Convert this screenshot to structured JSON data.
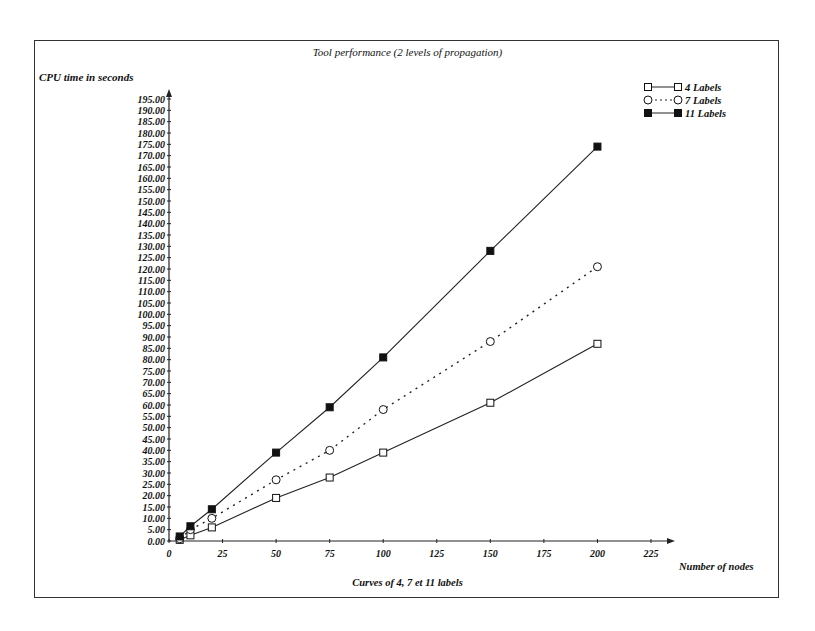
{
  "chart_data": {
    "type": "line",
    "title": "Tool performance (2 levels of propagation)",
    "ylabel": "CPU time in seconds",
    "xlabel": "Number of nodes",
    "caption": "Curves of 4, 7 et 11 labels",
    "xlim": [
      0,
      225
    ],
    "ylim": [
      0,
      195
    ],
    "x_ticks": [
      0,
      25,
      50,
      75,
      100,
      125,
      150,
      175,
      200,
      225
    ],
    "y_ticks": [
      "0.00",
      "5.00",
      "10.00",
      "15.00",
      "20.00",
      "25.00",
      "30.00",
      "35.00",
      "40.00",
      "45.00",
      "50.00",
      "55.00",
      "60.00",
      "65.00",
      "70.00",
      "75.00",
      "80.00",
      "85.00",
      "90.00",
      "95.00",
      "100.00",
      "105.00",
      "110.00",
      "115.00",
      "120.00",
      "125.00",
      "130.00",
      "135.00",
      "140.00",
      "145.00",
      "150.00",
      "155.00",
      "160.00",
      "165.00",
      "170.00",
      "175.00",
      "180.00",
      "185.00",
      "190.00",
      "195.00"
    ],
    "grid": false,
    "legend_position": "top-right",
    "x": [
      5,
      10,
      20,
      50,
      75,
      100,
      150,
      200
    ],
    "series": [
      {
        "name": "4 Labels",
        "marker": "open-square",
        "line": "solid",
        "values": [
          0.5,
          2.5,
          6,
          19,
          28,
          39,
          61,
          87
        ]
      },
      {
        "name": "7 Labels",
        "marker": "open-circle",
        "line": "dotted",
        "values": [
          1,
          5,
          10,
          27,
          40,
          58,
          88,
          121
        ]
      },
      {
        "name": "11 Labels",
        "marker": "filled-square",
        "line": "solid",
        "values": [
          2,
          6.5,
          14,
          39,
          59,
          81,
          128,
          174
        ]
      }
    ]
  },
  "legend": {
    "items": [
      {
        "label": "4 Labels"
      },
      {
        "label": "7 Labels"
      },
      {
        "label": "11 Labels"
      }
    ]
  }
}
